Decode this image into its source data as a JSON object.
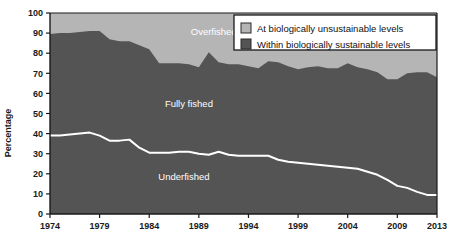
{
  "chart_data": {
    "type": "area",
    "title": "",
    "subtitle": "",
    "xlabel": "",
    "ylabel": "Percentage",
    "xlim": [
      1974,
      2013
    ],
    "ylim": [
      0,
      100
    ],
    "grid": false,
    "stacked": true,
    "legend_position": "top-right",
    "x": [
      1974,
      1975,
      1976,
      1977,
      1978,
      1979,
      1980,
      1981,
      1982,
      1983,
      1984,
      1985,
      1986,
      1987,
      1988,
      1989,
      1990,
      1991,
      1992,
      1993,
      1994,
      1995,
      1996,
      1997,
      1998,
      1999,
      2000,
      2001,
      2002,
      2003,
      2004,
      2005,
      2006,
      2007,
      2008,
      2009,
      2010,
      2011,
      2012,
      2013
    ],
    "xtick_labels": [
      "1974",
      "1979",
      "1984",
      "1989",
      "1994",
      "1999",
      "2004",
      "2009",
      "2013"
    ],
    "xticks": [
      1974,
      1979,
      1984,
      1989,
      1994,
      1999,
      2004,
      2009,
      2013
    ],
    "ytick_labels": [
      "0",
      "10",
      "20",
      "30",
      "40",
      "50",
      "60",
      "70",
      "80",
      "90",
      "100"
    ],
    "yticks": [
      0,
      10,
      20,
      30,
      40,
      50,
      60,
      70,
      80,
      90,
      100
    ],
    "series": [
      {
        "name": "Underfished",
        "label": "Underfished",
        "color": "#545454",
        "values": [
          39,
          39,
          39.5,
          40,
          40.5,
          39,
          36.5,
          36.5,
          37,
          33,
          30.5,
          30.5,
          30.5,
          31,
          31,
          30,
          29.5,
          31,
          29.5,
          29,
          29,
          29,
          29,
          27,
          26,
          25.5,
          25,
          24.5,
          24,
          23.5,
          23,
          22.5,
          21,
          19.5,
          17,
          14,
          13,
          11,
          9.5,
          9.5
        ]
      },
      {
        "name": "Fully fished",
        "label": "Fully fished",
        "color": "#545454",
        "values": [
          50.5,
          51,
          50.5,
          50.5,
          50.5,
          52,
          50.5,
          49.5,
          49,
          51,
          51.5,
          44.5,
          44.5,
          44,
          43.5,
          43,
          51,
          44.5,
          45,
          45.5,
          44.5,
          43.5,
          47,
          48.5,
          47.5,
          46.5,
          48,
          49,
          48.5,
          49,
          52,
          50.5,
          51,
          51,
          50,
          53,
          57,
          59.5,
          61,
          58.5
        ]
      },
      {
        "name": "Overfished",
        "label": "Overfished",
        "color": "#b5b5b5",
        "values": [
          10.5,
          10,
          10,
          9.5,
          9,
          9,
          13,
          14,
          14,
          16,
          18,
          25,
          25,
          25,
          25.5,
          27,
          19.5,
          24.5,
          25.5,
          25.5,
          26.5,
          27.5,
          24,
          24.5,
          26.5,
          28,
          27,
          26.5,
          27.5,
          27.5,
          25,
          27,
          28,
          29.5,
          33,
          33,
          30,
          29.5,
          29.5,
          32
        ]
      }
    ],
    "boundary_sustainable_top": [
      89.5,
      90,
      90,
      90.5,
      91,
      91,
      87,
      86,
      86,
      84,
      82,
      75,
      75,
      75,
      74.5,
      73,
      80.5,
      75.5,
      74.5,
      74.5,
      73.5,
      72.5,
      76,
      75.5,
      73.5,
      72,
      73,
      73.5,
      72.5,
      72.5,
      75,
      73,
      72,
      70.5,
      67,
      67,
      70,
      70.5,
      70.5,
      68
    ],
    "area_labels": [
      {
        "name": "overfished-label",
        "text": "Overfished",
        "x": 1990.5,
        "y": 89
      },
      {
        "name": "fully-fished-label",
        "text": "Fully fished",
        "x": 1988.0,
        "y": 53
      },
      {
        "name": "underfished-label",
        "text": "Underfished",
        "x": 1987.5,
        "y": 17
      }
    ],
    "legend": [
      {
        "label": "At biologically unsustainable levels",
        "color": "#b5b5b5"
      },
      {
        "label": "Within biologically sustainable levels",
        "color": "#545454"
      }
    ],
    "colors": {
      "unsustainable": "#b5b5b5",
      "sustainable": "#545454",
      "underfished_line": "#ffffff",
      "axis": "#1a1a1a",
      "legend_bg": "#ffffff",
      "legend_border": "#1a1a1a",
      "page_bg": "#ffffff"
    }
  }
}
